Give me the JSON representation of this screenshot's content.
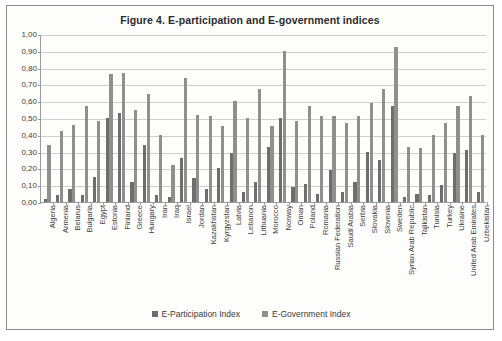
{
  "figure": {
    "title": "Figure 4.  E-participation and E-government indices"
  },
  "legend": {
    "position": "bottom",
    "items": [
      {
        "label": "E-Participation Index",
        "color": "#6e6e6e",
        "marker": "square-swatch-icon"
      },
      {
        "label": "E-Government Index",
        "color": "#8f8f8f",
        "marker": "square-swatch-icon"
      }
    ]
  },
  "axes": {
    "y_tick_labels": [
      "1,00",
      "0,90",
      "0,80",
      "0,70",
      "0,60",
      "0,50",
      "0,40",
      "0,30",
      "0,20",
      "0,10",
      "0,00"
    ]
  },
  "chart_data": {
    "type": "bar",
    "title": "Figure 4.  E-participation and E-government indices",
    "xlabel": "",
    "ylabel": "",
    "ylim": [
      0,
      1.0
    ],
    "ytick_step": 0.1,
    "grid": true,
    "legend_position": "bottom",
    "decimal_separator": ",",
    "categories": [
      "Algeria",
      "Armenia",
      "Belarus",
      "Bulgaria",
      "Egypt",
      "Estonia",
      "Finland",
      "Greece",
      "Hungary",
      "Iran",
      "Iraq",
      "Israel",
      "Jordan",
      "Kazakhstan",
      "Kyrgyzstan",
      "Latvia",
      "Lebanon",
      "Lithuania",
      "Morocco",
      "Norway",
      "Oman",
      "Poland",
      "Romania",
      "Russian Federation",
      "Saudi Arabia",
      "Serbia",
      "Slovakia",
      "Slovenia",
      "Sweden",
      "Syrian Arab Republic",
      "Tajikistan",
      "Tunisia",
      "Turkey",
      "Ukraine",
      "United Arab Emirates",
      "Uzbekistan"
    ],
    "series": [
      {
        "name": "E-Participation Index",
        "color": "#6e6e6e",
        "values": [
          0.02,
          0.04,
          0.08,
          0.04,
          0.15,
          0.5,
          0.53,
          0.12,
          0.34,
          0.04,
          0.03,
          0.26,
          0.14,
          0.08,
          0.2,
          0.29,
          0.06,
          0.12,
          0.33,
          0.5,
          0.09,
          0.11,
          0.05,
          0.19,
          0.06,
          0.12,
          0.3,
          0.25,
          0.57,
          0.03,
          0.05,
          0.04,
          0.1,
          0.29,
          0.31,
          0.06
        ]
      },
      {
        "name": "E-Government Index",
        "color": "#8f8f8f",
        "values": [
          0.34,
          0.42,
          0.46,
          0.57,
          0.48,
          0.76,
          0.77,
          0.55,
          0.64,
          0.4,
          0.22,
          0.74,
          0.52,
          0.51,
          0.45,
          0.6,
          0.5,
          0.67,
          0.45,
          0.9,
          0.48,
          0.57,
          0.51,
          0.51,
          0.47,
          0.51,
          0.59,
          0.67,
          0.92,
          0.33,
          0.32,
          0.4,
          0.47,
          0.57,
          0.63,
          0.4
        ]
      }
    ]
  }
}
